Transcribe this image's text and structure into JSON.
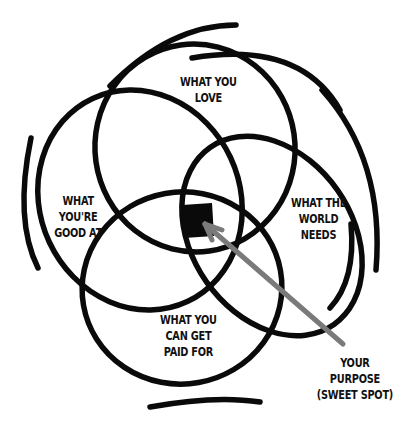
{
  "diagram": {
    "colors": {
      "stroke": "#0a0a0a",
      "arrow": "#7a7a7a",
      "center_fill": "#0a0a0a",
      "background": "#ffffff"
    },
    "circles": [
      {
        "id": "love",
        "lines": [
          "WHAT YOU",
          "LOVE"
        ]
      },
      {
        "id": "good_at",
        "lines": [
          "WHAT",
          "YOU'RE",
          "GOOD AT"
        ]
      },
      {
        "id": "world_needs",
        "lines": [
          "WHAT THE",
          "WORLD",
          "NEEDS"
        ]
      },
      {
        "id": "paid_for",
        "lines": [
          "WHAT YOU",
          "CAN GET",
          "PAID FOR"
        ]
      }
    ],
    "callout": {
      "lines": [
        "YOUR",
        "PURPOSE",
        "(SWEET SPOT)"
      ]
    }
  }
}
